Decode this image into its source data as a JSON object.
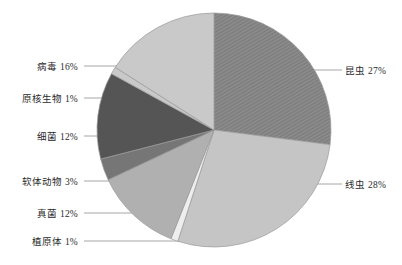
{
  "chart_data": {
    "type": "pie",
    "title": "",
    "subtitle": "",
    "xlabel": "",
    "ylabel": "",
    "legend_position": "none",
    "grid": false,
    "labels_show_percent": true,
    "total_percent": 100,
    "categories": [
      "昆虫",
      "线虫",
      "植原体",
      "真菌",
      "软体动物",
      "细菌",
      "原核生物",
      "病毒"
    ],
    "values": [
      27,
      28,
      1,
      12,
      3,
      12,
      1,
      16
    ],
    "slices": [
      {
        "name": "昆虫",
        "value": 27,
        "label": "昆虫 27%",
        "color": "#8a8a8a",
        "hatched": true,
        "start_angle": 0,
        "end_angle": 97.2,
        "label_side": "right",
        "label_x": 345,
        "label_y": 67,
        "leader_x1": 310,
        "leader_x2": 342,
        "leader_y": 70
      },
      {
        "name": "线虫",
        "value": 28,
        "label": "线虫 28%",
        "color": "#c5c5c5",
        "hatched": false,
        "start_angle": 97.2,
        "end_angle": 198.0,
        "label_side": "right",
        "label_x": 345,
        "label_y": 181,
        "leader_x1": 310,
        "leader_x2": 342,
        "leader_y": 184
      },
      {
        "name": "植原体",
        "value": 1,
        "label": "植原体 1%",
        "color": "#eeeeee",
        "hatched": false,
        "start_angle": 198.0,
        "end_angle": 201.6,
        "label_side": "left",
        "label_x": 78,
        "label_y": 238,
        "leader_x1": 84,
        "leader_x2": 196,
        "leader_y": 241
      },
      {
        "name": "真菌",
        "value": 12,
        "label": "真菌 12%",
        "color": "#b0b0b0",
        "hatched": false,
        "start_angle": 201.6,
        "end_angle": 244.8,
        "label_side": "left",
        "label_x": 78,
        "label_y": 210,
        "leader_x1": 84,
        "leader_x2": 160,
        "leader_y": 213
      },
      {
        "name": "软体动物",
        "value": 3,
        "label": "软体动物 3%",
        "color": "#767676",
        "hatched": false,
        "start_angle": 244.8,
        "end_angle": 255.6,
        "label_side": "left",
        "label_x": 78,
        "label_y": 178,
        "leader_x1": 84,
        "leader_x2": 134,
        "leader_y": 181
      },
      {
        "name": "细菌",
        "value": 12,
        "label": "细菌 12%",
        "color": "#555555",
        "hatched": false,
        "start_angle": 255.6,
        "end_angle": 298.8,
        "label_side": "left",
        "label_x": 78,
        "label_y": 133,
        "leader_x1": 84,
        "leader_x2": 110,
        "leader_y": 136
      },
      {
        "name": "原核生物",
        "value": 1,
        "label": "原核生物 1%",
        "color": "#c9c9c9",
        "hatched": false,
        "start_angle": 298.8,
        "end_angle": 302.4,
        "label_side": "left",
        "label_x": 78,
        "label_y": 95,
        "leader_x1": 84,
        "leader_x2": 120,
        "leader_y": 98
      },
      {
        "name": "病毒",
        "value": 16,
        "label": "病毒 16%",
        "color": "#c9c9c9",
        "hatched": false,
        "start_angle": 302.4,
        "end_angle": 360,
        "label_side": "left",
        "label_x": 78,
        "label_y": 63,
        "leader_x1": 84,
        "leader_x2": 143,
        "leader_y": 66
      }
    ],
    "geometry": {
      "center_x": 214,
      "center_y": 130,
      "radius": 117
    },
    "style": {
      "background": "#ffffff",
      "slice_border": "#9a9a9a",
      "leader_line_color": "#8f8f8f",
      "text_color": "#2b2b2b"
    }
  }
}
